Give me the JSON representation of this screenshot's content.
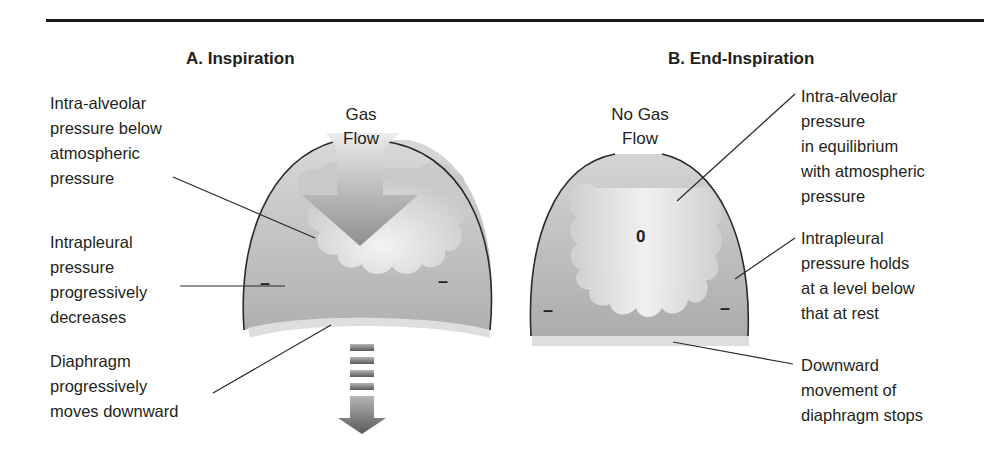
{
  "figure": {
    "panels": [
      {
        "id": "A",
        "title": "A. Inspiration",
        "center_label": "Gas\nFlow",
        "labels": {
          "intra_alveolar": "Intra-alveolar\npressure below\natmospheric\npressure",
          "intrapleural": "Intrapleural\npressure\nprogressively\ndecreases",
          "diaphragm": "Diaphragm\nprogressively\nmoves downward"
        },
        "pleural_signs": [
          "–",
          "–"
        ]
      },
      {
        "id": "B",
        "title": "B. End-Inspiration",
        "center_label": "No Gas\nFlow",
        "alveolar_value": "0",
        "labels": {
          "intra_alveolar": "Intra-alveolar\npressure\nin equilibrium\nwith atmospheric\npressure",
          "intrapleural": "Intrapleural\npressure holds\nat a level below\nthat at rest",
          "diaphragm": "Downward\nmovement of\ndiaphragm stops"
        },
        "pleural_signs": [
          "–",
          "–"
        ]
      }
    ],
    "colors": {
      "outline": "#2a2a2a",
      "pleural_fill": "#b9b9b9",
      "lung_fill": "#e4e4e4",
      "diaphragm": "#dcdcdc",
      "arrow": "#8c8c8c",
      "text": "#231f20"
    }
  }
}
